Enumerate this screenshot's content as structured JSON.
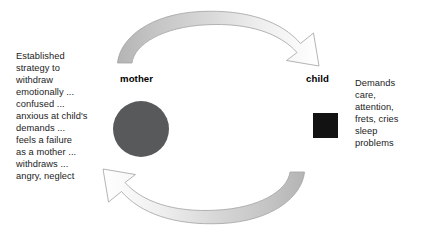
{
  "diagram": {
    "background_color": "#ffffff",
    "left_text": "Established\nstrategy  to\nwithdraw\nemotionally ...\nconfused ...\nanxious at child's\ndemands ...\nfeels a failure\nas a mother ...\nwithdraws ...\nangry, neglect",
    "right_text": "Demands\ncare,\nattention,\nfrets, cries\nsleep\nproblems",
    "nodes": [
      {
        "id": "mother",
        "label": "mother",
        "shape": "circle",
        "color": "#58595b"
      },
      {
        "id": "child",
        "label": "child",
        "shape": "square",
        "color": "#121212"
      }
    ],
    "arrows": [
      {
        "id": "mother-to-child",
        "name": "top-arrow",
        "direction": "mother-to-child",
        "position": "top",
        "tail_color": "#c9c9c9",
        "head_color": "#ffffff",
        "outline_color": "#a7a7a7"
      },
      {
        "id": "child-to-mother",
        "name": "bottom-arrow",
        "direction": "child-to-mother",
        "position": "bottom",
        "tail_color": "#c9c9c9",
        "head_color": "#ffffff",
        "outline_color": "#a7a7a7"
      }
    ]
  }
}
